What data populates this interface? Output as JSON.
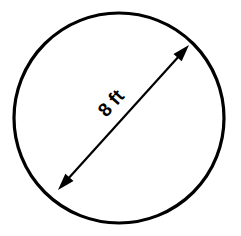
{
  "figure": {
    "type": "geometry-diagram",
    "shape_name": "circle",
    "background_color": "#ffffff",
    "stroke_color": "#000000",
    "text_color": "#000000"
  },
  "circle": {
    "center_x": 119,
    "center_y": 118,
    "radius": 105,
    "stroke_width": 3.2
  },
  "diameter": {
    "label": "8 ft",
    "value": 8,
    "unit": "ft",
    "label_rotation_deg": -48,
    "label_x": 112,
    "label_y": 104,
    "line_stroke_width": 2.2,
    "start_x": 58,
    "start_y": 190,
    "end_x": 189,
    "end_y": 45,
    "arrow_style": "double-headed",
    "arrow_length": 17,
    "arrow_half_width": 5.5
  }
}
